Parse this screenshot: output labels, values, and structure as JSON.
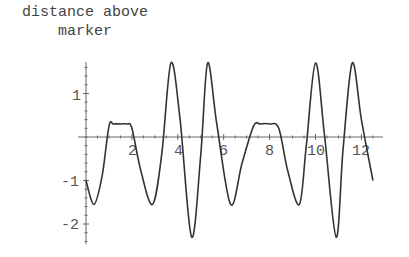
{
  "chart_data": {
    "type": "line",
    "title": "",
    "xlabel": "",
    "ylabel": "distance above marker",
    "ylabel_lines": [
      "distance above",
      "marker"
    ],
    "xlim": [
      0,
      12.6
    ],
    "ylim": [
      -2.4,
      1.9
    ],
    "x_ticks": [
      2,
      4,
      6,
      8,
      10,
      12
    ],
    "y_ticks": [
      1,
      -1,
      -2
    ],
    "grid": false,
    "legend": null,
    "series": [
      {
        "name": "distance above marker",
        "color": "#333333",
        "points": [
          [
            0.0,
            -1.0
          ],
          [
            0.35,
            -1.55
          ],
          [
            0.7,
            -0.9
          ],
          [
            1.0,
            0.25
          ],
          [
            1.2,
            0.3
          ],
          [
            1.5,
            0.3
          ],
          [
            1.8,
            0.3
          ],
          [
            2.0,
            0.2
          ],
          [
            2.4,
            -0.8
          ],
          [
            2.9,
            -1.55
          ],
          [
            3.3,
            -0.4
          ],
          [
            3.7,
            1.7
          ],
          [
            4.1,
            0.4
          ],
          [
            4.6,
            -2.3
          ],
          [
            5.0,
            -0.4
          ],
          [
            5.3,
            1.7
          ],
          [
            5.7,
            0.3
          ],
          [
            6.3,
            -1.55
          ],
          [
            6.8,
            -0.6
          ],
          [
            7.3,
            0.25
          ],
          [
            7.6,
            0.3
          ],
          [
            8.0,
            0.3
          ],
          [
            8.4,
            0.2
          ],
          [
            8.8,
            -0.8
          ],
          [
            9.3,
            -1.55
          ],
          [
            9.6,
            -0.2
          ],
          [
            10.0,
            1.7
          ],
          [
            10.4,
            0.0
          ],
          [
            10.9,
            -2.3
          ],
          [
            11.2,
            -0.3
          ],
          [
            11.6,
            1.7
          ],
          [
            12.0,
            0.4
          ],
          [
            12.5,
            -1.0
          ]
        ]
      }
    ]
  },
  "labels": {
    "ylabel_line1": "distance above",
    "ylabel_line2": "marker",
    "xt2": "2",
    "xt4": "4",
    "xt6": "6",
    "xt8": "8",
    "xt10": "10",
    "xt12": "12",
    "yt1": "1",
    "ytm1": "-1",
    "ytm2": "-2"
  }
}
